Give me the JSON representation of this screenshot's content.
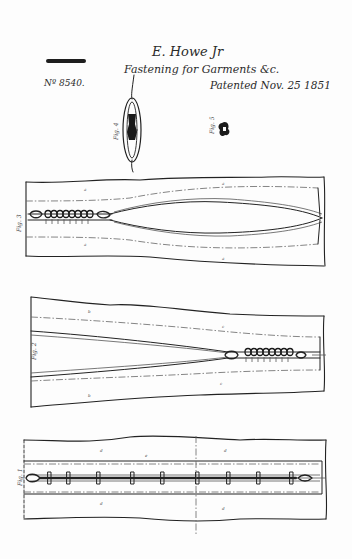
{
  "document": {
    "type": "patent-drawing",
    "inventor": "E. Howe Jr",
    "title": "Fastening for Garments &c.",
    "patent_number": "Nº 8540.",
    "patent_date": "Patented Nov. 25 1851",
    "ink_color": "#222222",
    "paper_color": "#fdfdfd"
  },
  "figures": [
    {
      "id": "fig-1",
      "label": "Fig. 1",
      "description": "closed fastening, full length"
    },
    {
      "id": "fig-2",
      "label": "Fig. 2",
      "description": "fastening partially closed, slider at right"
    },
    {
      "id": "fig-3",
      "label": "Fig. 3",
      "description": "fastening open, slider at left"
    },
    {
      "id": "fig-4",
      "label": "Fig. 4",
      "description": "cross section, elliptical"
    },
    {
      "id": "fig-5",
      "label": "Fig. 5",
      "description": "detail of clasp"
    }
  ],
  "reference_letters": [
    "a",
    "a",
    "b",
    "b",
    "c",
    "c",
    "d",
    "e"
  ]
}
